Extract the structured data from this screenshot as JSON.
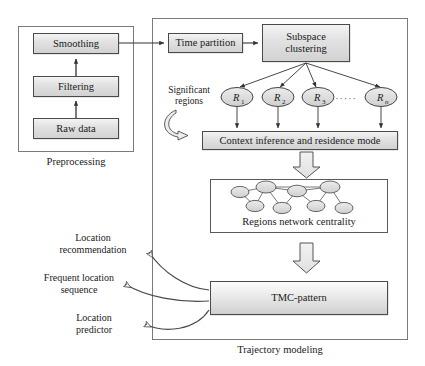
{
  "figure": {
    "type": "flowchart"
  },
  "preprocessing": {
    "caption": "Preprocessing",
    "steps": [
      {
        "label": "Raw data"
      },
      {
        "label": "Filtering"
      },
      {
        "label": "Smoothing"
      }
    ]
  },
  "trajectory": {
    "caption": "Trajectory modeling",
    "time_partition": "Time partition",
    "subspace_clustering": "Subspace\nclustering",
    "subspace_clustering_line1": "Subspace",
    "subspace_clustering_line2": "clustering",
    "significant_regions_line1": "Significant",
    "significant_regions_line2": "regions",
    "regions": [
      {
        "label": "R",
        "sub": "1"
      },
      {
        "label": "R",
        "sub": "2"
      },
      {
        "label": "R",
        "sub": "3"
      },
      {
        "label": "R",
        "sub": "n"
      }
    ],
    "regions_ellipsis": "·····",
    "context_inference": "Context inference and residence mode",
    "regions_network": "Regions network centrality",
    "tmc_pattern": "TMC-pattern"
  },
  "outputs": [
    {
      "line1": "Location",
      "line2": "recommendation"
    },
    {
      "line1": "Frequent location",
      "line2": "sequence"
    },
    {
      "line1": "Location",
      "line2": "predictor"
    }
  ],
  "network_graph": {
    "nodes": [
      {
        "id": "n1",
        "cx": 240,
        "cy": 192
      },
      {
        "id": "n2",
        "cx": 266,
        "cy": 187
      },
      {
        "id": "n3",
        "cx": 297,
        "cy": 191
      },
      {
        "id": "n4",
        "cx": 330,
        "cy": 187
      },
      {
        "id": "n5",
        "cx": 255,
        "cy": 206
      },
      {
        "id": "n6",
        "cx": 282,
        "cy": 208
      },
      {
        "id": "n7",
        "cx": 316,
        "cy": 206
      },
      {
        "id": "n8",
        "cx": 344,
        "cy": 208
      }
    ],
    "edges": [
      [
        "n1",
        "n2"
      ],
      [
        "n2",
        "n3"
      ],
      [
        "n3",
        "n4"
      ],
      [
        "n2",
        "n4"
      ],
      [
        "n1",
        "n5"
      ],
      [
        "n2",
        "n5"
      ],
      [
        "n2",
        "n6"
      ],
      [
        "n3",
        "n6"
      ],
      [
        "n3",
        "n7"
      ],
      [
        "n4",
        "n7"
      ],
      [
        "n4",
        "n8"
      ]
    ]
  },
  "colors": {
    "box_fill_light": "#f4f4f4",
    "box_fill_dark": "#d2d2d2",
    "box_stroke": "#4a4a4a",
    "arrow_stroke": "#3a3a3a",
    "block_arrow_fill": "#e8e8e8",
    "node_fill": "#dedede",
    "page_bg": "#ffffff"
  }
}
